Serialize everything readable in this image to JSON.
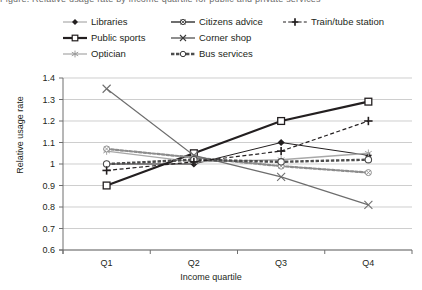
{
  "title": "Figure: Relative usage rate by income quartile for public and private services",
  "chart_data": {
    "type": "line",
    "title": "",
    "xlabel": "Income quartile",
    "ylabel": "Relative usage rate",
    "categories": [
      "Q1",
      "Q2",
      "Q3",
      "Q4"
    ],
    "ylim": [
      0.6,
      1.4
    ],
    "yticks": [
      "0.6",
      "0.7",
      "0.8",
      "0.9",
      "1",
      "1.1",
      "1.2",
      "1.3",
      "1.4"
    ],
    "ytick_values": [
      0.6,
      0.7,
      0.8,
      0.9,
      1.0,
      1.1,
      1.2,
      1.3,
      1.4
    ],
    "grid": true,
    "legend_position": "top",
    "series": [
      {
        "name": "Libraries",
        "values": [
          1.0,
          1.0,
          1.1,
          1.04
        ],
        "color": "#231f20",
        "marker": "diamond",
        "line": "solid",
        "width": 1
      },
      {
        "name": "Public sports",
        "values": [
          0.9,
          1.05,
          1.2,
          1.29
        ],
        "color": "#231f20",
        "marker": "square",
        "line": "solid",
        "width": 2.2
      },
      {
        "name": "Optician",
        "values": [
          1.06,
          1.01,
          1.02,
          1.05
        ],
        "color": "#a8a8a8",
        "marker": "star",
        "line": "solid",
        "width": 1.4
      },
      {
        "name": "Citizens advice",
        "values": [
          1.07,
          1.03,
          0.99,
          0.96
        ],
        "color": "#8c8c8c",
        "marker": "circle",
        "line": "dotted",
        "width": 2.2
      },
      {
        "name": "Corner shop",
        "values": [
          1.35,
          1.04,
          0.94,
          0.81
        ],
        "color": "#6d6d6d",
        "marker": "x",
        "line": "solid",
        "width": 1.2
      },
      {
        "name": "Bus services",
        "values": [
          1.0,
          1.02,
          1.01,
          1.02
        ],
        "color": "#4d4d4d",
        "marker": "circle-open",
        "line": "dashed-thick",
        "width": 2.4
      },
      {
        "name": "Train/tube station",
        "values": [
          0.97,
          1.01,
          1.06,
          1.2
        ],
        "color": "#231f20",
        "marker": "plus",
        "line": "dashed",
        "width": 1.2
      }
    ]
  },
  "legend": {
    "items": [
      {
        "label": "Libraries",
        "marker_name": "legend-marker-libraries"
      },
      {
        "label": "Citizens advice",
        "marker_name": "legend-marker-citizens-advice"
      },
      {
        "label": "Train/tube station",
        "marker_name": "legend-marker-train-tube-station"
      },
      {
        "label": "Public sports",
        "marker_name": "legend-marker-public-sports"
      },
      {
        "label": "Corner shop",
        "marker_name": "legend-marker-corner-shop"
      },
      {
        "label": "Optician",
        "marker_name": "legend-marker-optician"
      },
      {
        "label": "Bus services",
        "marker_name": "legend-marker-bus-services"
      }
    ]
  }
}
